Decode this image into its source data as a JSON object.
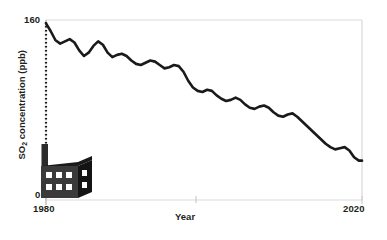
{
  "chart_data": {
    "type": "line",
    "title": "",
    "xlabel": "Year",
    "ylabel": "SO2 concentration (ppb)",
    "ylabel_parts": {
      "prefix": "SO",
      "sub": "2",
      "suffix": " concentration (ppb)"
    },
    "xlim": [
      1980,
      2020
    ],
    "ylim": [
      0,
      160
    ],
    "xticks": [
      1980,
      2020
    ],
    "xticklabels": [
      "1980",
      "2020"
    ],
    "yticks": [
      0,
      160
    ],
    "yticklabels": [
      "0",
      "160"
    ],
    "grid": false,
    "legend": null,
    "line_color": "#1a1a1a",
    "line_width": 2.6,
    "box_color": "#d9d9d9",
    "x": [
      1980.0,
      1980.6,
      1981.2,
      1981.8,
      1982.4,
      1983.0,
      1983.6,
      1984.2,
      1984.8,
      1985.4,
      1986.0,
      1986.6,
      1987.2,
      1987.8,
      1988.4,
      1989.0,
      1989.6,
      1990.2,
      1990.8,
      1991.4,
      1992.0,
      1992.6,
      1993.2,
      1993.8,
      1994.4,
      1995.0,
      1995.6,
      1996.2,
      1996.8,
      1997.4,
      1998.0,
      1998.6,
      1999.2,
      1999.8,
      2000.4,
      2001.0,
      2001.6,
      2002.2,
      2002.8,
      2003.4,
      2004.0,
      2004.6,
      2005.2,
      2005.8,
      2006.4,
      2007.0,
      2007.6,
      2008.2,
      2008.8,
      2009.4,
      2010.0,
      2010.6,
      2011.2,
      2011.8,
      2012.4,
      2013.0,
      2013.6,
      2014.2,
      2014.8,
      2015.4,
      2016.0,
      2016.6,
      2017.2,
      2017.8,
      2018.4,
      2019.0,
      2019.6,
      2020.0
    ],
    "y": [
      157,
      150,
      142,
      139,
      141,
      143,
      140,
      133,
      128,
      131,
      137,
      141,
      138,
      131,
      127,
      129,
      130,
      128,
      124,
      121,
      120,
      122,
      124,
      123,
      120,
      117,
      118,
      120,
      119,
      114,
      106,
      100,
      97,
      96,
      98,
      97,
      93,
      90,
      88,
      89,
      91,
      89,
      85,
      82,
      81,
      83,
      84,
      82,
      78,
      75,
      74,
      76,
      77,
      74,
      70,
      66,
      62,
      58,
      54,
      50,
      47,
      45,
      46,
      47,
      44,
      38,
      35,
      35
    ],
    "annotation_icon": "factory-icon",
    "annotation_note": "smokestack with dotted emission trail at left edge"
  },
  "axes": {
    "y_top_label": "160",
    "y_bottom_label": "0",
    "x_left_label": "1980",
    "x_right_label": "2020",
    "x_title": "Year",
    "y_title_prefix": "SO",
    "y_title_sub": "2",
    "y_title_suffix": " concentration (ppb)"
  },
  "icons": {
    "factory": "factory-icon",
    "smokestack": "smokestack-icon",
    "smoke_trail": "dotted-smoke-trail-icon"
  },
  "colors": {
    "line": "#1a1a1a",
    "frame": "#d9d9d9",
    "factory_body": "#333333",
    "factory_side": "#1a1a1a",
    "window": "#ffffff",
    "text": "#231f20"
  }
}
